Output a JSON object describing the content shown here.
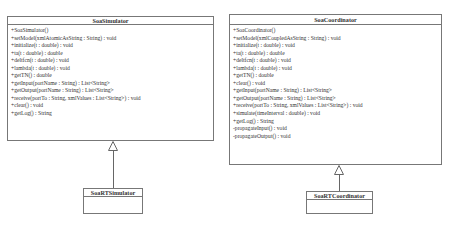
{
  "diagram": {
    "type": "uml-class-diagram",
    "classes": {
      "simulator": {
        "name": "SoaSimulator",
        "operations": [
          "+SoaSimulator()",
          "+setModel(xmlAtomicAsString : String) : void",
          "+initialize(t : double) : void",
          "+ta(t : double) : double",
          "+deltfcn(t : double) : void",
          "+lambda(t : double) : void",
          "+getTN() : double",
          "+getInput(portName : String) : List<String>",
          "+getOutput(portName : String) : List<String>",
          "+receive(portTo : String, xmlValues : List<String>) : void",
          "+clear() : void",
          "+getLog() : String"
        ]
      },
      "coordinator": {
        "name": "SoaCoordinator",
        "operations": [
          "+SoaCoordinator()",
          "+setModel(xmlCoupledAsString : String) : void",
          "+initialize(t : double) : void",
          "+ta(t : double) : double",
          "+deltfcn(t : double) : void",
          "+lambda(t : double) : void",
          "+getTN() : double",
          "+clear() : void",
          "+getInput(portName : String) : List<String>",
          "+getOutput(portName : String) : List<String>",
          "+receive(portTo : String, xmlValues : List<String>) : void",
          "+simulate(timeInterval : double) : void",
          "+getLog() : String",
          "-propagateInput() : void",
          "-propagateOutput() : void"
        ]
      },
      "rt_simulator": {
        "name": "SoaRTSimulator",
        "operations": []
      },
      "rt_coordinator": {
        "name": "SoaRTCoordinator",
        "operations": []
      }
    },
    "relations": [
      {
        "type": "generalization",
        "from": "SoaRTSimulator",
        "to": "SoaSimulator"
      },
      {
        "type": "generalization",
        "from": "SoaRTCoordinator",
        "to": "SoaCoordinator"
      }
    ]
  }
}
